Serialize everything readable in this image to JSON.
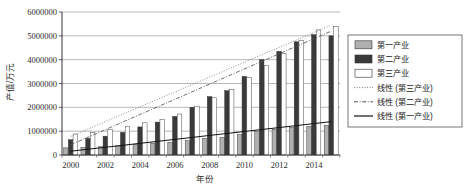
{
  "chart_data": {
    "type": "bar",
    "title": "",
    "xlabel": "年份",
    "ylabel": "产值/万元",
    "grid": true,
    "legend_position": "right",
    "xlim": [
      2000,
      2015
    ],
    "ylim": [
      0,
      6000000
    ],
    "ytick_values": [
      0,
      1000000,
      2000000,
      3000000,
      4000000,
      5000000,
      6000000
    ],
    "ytick_labels": [
      "0",
      "1000000",
      "2000000",
      "3000000",
      "4000000",
      "5000000",
      "6000000"
    ],
    "categories": [
      2000,
      2001,
      2002,
      2003,
      2004,
      2005,
      2006,
      2007,
      2008,
      2009,
      2010,
      2011,
      2012,
      2013,
      2014,
      2015
    ],
    "xtick_labels": [
      "2000",
      "2002",
      "2004",
      "2006",
      "2008",
      "2010",
      "2012",
      "2014"
    ],
    "xtick_values": [
      2000,
      2002,
      2004,
      2006,
      2008,
      2010,
      2012,
      2014
    ],
    "series": [
      {
        "name": "第一产业",
        "color": "#b0b0b0",
        "values": [
          300000,
          320000,
          345000,
          380000,
          450000,
          500000,
          530000,
          600000,
          700000,
          740000,
          850000,
          980000,
          1080000,
          1150000,
          1200000,
          1240000
        ]
      },
      {
        "name": "第二产业",
        "color": "#3a3a3a",
        "values": [
          640000,
          700000,
          790000,
          950000,
          1180000,
          1380000,
          1620000,
          2000000,
          2450000,
          2700000,
          3300000,
          4000000,
          4350000,
          4750000,
          5050000,
          5000000
        ]
      },
      {
        "name": "第三产业",
        "color": "#ffffff",
        "values": [
          880000,
          950000,
          1080000,
          1200000,
          1350000,
          1500000,
          1720000,
          2050000,
          2400000,
          2750000,
          3250000,
          3750000,
          4250000,
          4800000,
          5250000,
          5400000
        ]
      }
    ],
    "trendlines": [
      {
        "name": "线性 (第三产业)",
        "style": "dotted",
        "color": "#7a7a7a",
        "start": [
          2000,
          780000
        ],
        "end": [
          2015,
          5450000
        ]
      },
      {
        "name": "线性 (第二产业)",
        "style": "dashdot",
        "color": "#555555",
        "start": [
          2000,
          430000
        ],
        "end": [
          2015,
          5200000
        ]
      },
      {
        "name": "线性 (第一产业)",
        "style": "solid",
        "color": "#111111",
        "start": [
          2000,
          160000
        ],
        "end": [
          2015,
          1400000
        ]
      }
    ],
    "legend": [
      {
        "label": "第一产业",
        "marker": "swatch",
        "fill": "#b0b0b0"
      },
      {
        "label": "第二产业",
        "marker": "swatch",
        "fill": "#3a3a3a"
      },
      {
        "label": "第三产业",
        "marker": "swatch",
        "fill": "#ffffff"
      },
      {
        "label": "线性 (第三产业)",
        "marker": "dotted",
        "fill": "#7a7a7a"
      },
      {
        "label": "线性 (第二产业)",
        "marker": "dashdot",
        "fill": "#555555"
      },
      {
        "label": "线性 (第一产业)",
        "marker": "solid",
        "fill": "#111111"
      }
    ]
  }
}
